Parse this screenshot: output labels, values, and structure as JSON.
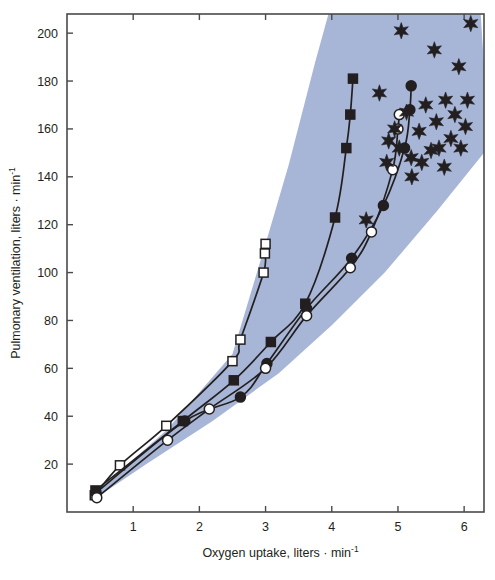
{
  "chart_data": {
    "type": "scatter",
    "title": "",
    "xlabel": "Oxygen uptake, liters · min⁻¹",
    "ylabel": "Pulmonary ventilation, liters · min⁻¹",
    "xlim": [
      0.0,
      6.3
    ],
    "ylim": [
      0,
      208
    ],
    "xticks": [
      1,
      2,
      3,
      4,
      5,
      6
    ],
    "xtick_labels": [
      "1",
      "2",
      "3",
      "4",
      "5",
      "6"
    ],
    "yticks": [
      20,
      40,
      60,
      80,
      100,
      120,
      140,
      160,
      180,
      200
    ],
    "ytick_labels": [
      "20",
      "40",
      "60",
      "80",
      "100",
      "120",
      "140",
      "160",
      "180",
      "200"
    ],
    "grid": false,
    "legend": "none",
    "frame": "full-box",
    "band": {
      "name": "shaded-normal-range",
      "color": "#a7b6d6",
      "description": "Light blue-gray wedge spanning the scatter envelope, widening to the right",
      "polygon": [
        [
          0.38,
          7
        ],
        [
          1.5,
          34
        ],
        [
          2.5,
          66
        ],
        [
          3.0,
          112
        ],
        [
          3.35,
          145
        ],
        [
          3.75,
          188
        ],
        [
          3.95,
          208
        ],
        [
          6.25,
          208
        ],
        [
          6.3,
          186
        ],
        [
          6.3,
          150
        ],
        [
          5.6,
          126
        ],
        [
          4.8,
          100
        ],
        [
          4.0,
          78
        ],
        [
          3.2,
          58
        ],
        [
          2.2,
          38
        ],
        [
          1.2,
          20
        ],
        [
          0.5,
          7
        ]
      ]
    },
    "series": [
      {
        "name": "open-squares",
        "marker": "open-square",
        "marker_fill": "#ffffff",
        "marker_edge": "#231f20",
        "line_color": "#231f20",
        "points": [
          [
            0.42,
            7
          ],
          [
            0.8,
            19.5
          ],
          [
            1.5,
            36
          ],
          [
            2.5,
            63
          ],
          [
            2.62,
            72
          ],
          [
            2.97,
            100
          ],
          [
            2.99,
            108
          ],
          [
            3.0,
            112
          ]
        ]
      },
      {
        "name": "filled-squares",
        "marker": "filled-square",
        "marker_fill": "#231f20",
        "marker_edge": "#231f20",
        "line_color": "#231f20",
        "points": [
          [
            0.43,
            9
          ],
          [
            1.75,
            38
          ],
          [
            2.52,
            55
          ],
          [
            3.08,
            71
          ],
          [
            3.6,
            87
          ],
          [
            4.05,
            123
          ],
          [
            4.22,
            152
          ],
          [
            4.28,
            166
          ],
          [
            4.32,
            181
          ]
        ]
      },
      {
        "name": "filled-circles",
        "marker": "filled-circle",
        "marker_fill": "#231f20",
        "marker_edge": "#231f20",
        "line_color": "#231f20",
        "points": [
          [
            0.44,
            8
          ],
          [
            1.78,
            38
          ],
          [
            2.62,
            48
          ],
          [
            3.02,
            62
          ],
          [
            3.62,
            85
          ],
          [
            4.3,
            106
          ],
          [
            4.78,
            128
          ],
          [
            5.1,
            152
          ],
          [
            5.18,
            168
          ],
          [
            5.2,
            178
          ]
        ]
      },
      {
        "name": "open-circles",
        "marker": "open-circle",
        "marker_fill": "#ffffff",
        "marker_edge": "#231f20",
        "line_color": "#231f20",
        "points": [
          [
            0.45,
            6
          ],
          [
            1.52,
            30
          ],
          [
            2.15,
            43
          ],
          [
            3.0,
            60
          ],
          [
            3.62,
            82
          ],
          [
            4.28,
            102
          ],
          [
            4.6,
            117
          ],
          [
            4.92,
            143
          ],
          [
            5.0,
            160
          ],
          [
            5.02,
            166
          ]
        ]
      },
      {
        "name": "stars-scatter",
        "marker": "six-point-star",
        "marker_fill": "#231f20",
        "line_color": "none",
        "points": [
          [
            4.52,
            122
          ],
          [
            4.83,
            146
          ],
          [
            4.86,
            155
          ],
          [
            4.95,
            160
          ],
          [
            5.02,
            152
          ],
          [
            5.13,
            167
          ],
          [
            5.2,
            148
          ],
          [
            5.21,
            140
          ],
          [
            5.32,
            159
          ],
          [
            5.36,
            146
          ],
          [
            5.42,
            170
          ],
          [
            5.5,
            151
          ],
          [
            5.55,
            193
          ],
          [
            5.58,
            163
          ],
          [
            5.62,
            152
          ],
          [
            5.7,
            144
          ],
          [
            5.72,
            172
          ],
          [
            5.8,
            156
          ],
          [
            5.86,
            166
          ],
          [
            5.92,
            186
          ],
          [
            5.95,
            152
          ],
          [
            6.02,
            161
          ],
          [
            6.05,
            172
          ],
          [
            6.1,
            204
          ],
          [
            4.72,
            175
          ],
          [
            5.05,
            201
          ]
        ]
      }
    ]
  }
}
